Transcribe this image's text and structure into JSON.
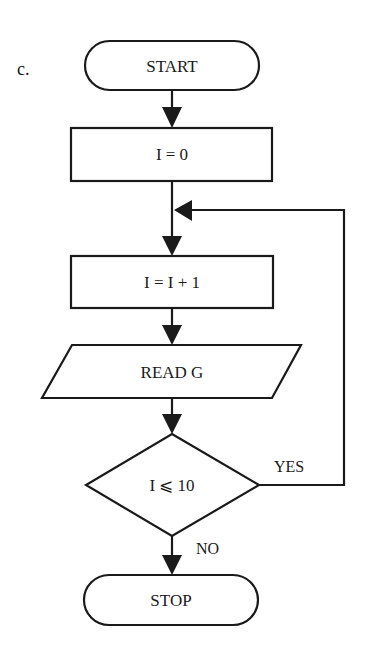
{
  "figure": {
    "label": "c."
  },
  "flowchart": {
    "nodes": [
      {
        "id": "start",
        "type": "terminal",
        "text": "START"
      },
      {
        "id": "init",
        "type": "process",
        "text": "I = 0"
      },
      {
        "id": "increment",
        "type": "process",
        "text": "I = I + 1"
      },
      {
        "id": "read",
        "type": "input-output",
        "text": "READ G"
      },
      {
        "id": "decision",
        "type": "decision",
        "text": "I ⩽ 10"
      },
      {
        "id": "stop",
        "type": "terminal",
        "text": "STOP"
      }
    ],
    "edges": [
      {
        "from": "start",
        "to": "init",
        "label": ""
      },
      {
        "from": "init",
        "to": "increment",
        "label": ""
      },
      {
        "from": "increment",
        "to": "read",
        "label": ""
      },
      {
        "from": "read",
        "to": "decision",
        "label": ""
      },
      {
        "from": "decision",
        "to": "increment",
        "label": "YES"
      },
      {
        "from": "decision",
        "to": "stop",
        "label": "NO"
      }
    ],
    "labels": {
      "yes": "YES",
      "no": "NO"
    }
  }
}
